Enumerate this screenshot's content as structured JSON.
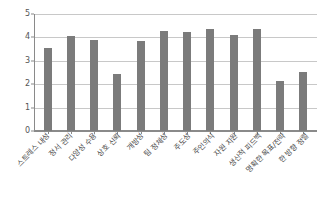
{
  "chart_data": {
    "type": "bar",
    "title": "",
    "subtitle": "",
    "xlabel": "",
    "ylabel": "",
    "ylim": [
      0,
      5
    ],
    "yticks": [
      0,
      1,
      2,
      3,
      4,
      5
    ],
    "ytick_labels": [
      "0",
      "1",
      "2",
      "3",
      "4",
      "5"
    ],
    "grid": true,
    "legend": false,
    "legend_position": "none",
    "bar_color": "#7b7b7b",
    "gridline_color": "#c8c8c8",
    "axis_color": "#8a8a8a",
    "background_color": "#ffffff",
    "categories": [
      "스트레스 내성",
      "정서 관리",
      "다양성 수용",
      "상호 신뢰",
      "개방성",
      "팀 정체성",
      "주도성",
      "주인의식",
      "자원 지원",
      "생산적 피드백",
      "명확한 목표/전략",
      "한 방향 정렬"
    ],
    "values": [
      3.55,
      4.08,
      3.88,
      2.42,
      3.86,
      4.26,
      4.22,
      4.36,
      4.12,
      4.38,
      2.13,
      2.54
    ],
    "series": [
      {
        "name": "",
        "values": [
          3.55,
          4.08,
          3.88,
          2.42,
          3.86,
          4.26,
          4.22,
          4.36,
          4.12,
          4.38,
          2.13,
          2.54
        ]
      }
    ]
  }
}
